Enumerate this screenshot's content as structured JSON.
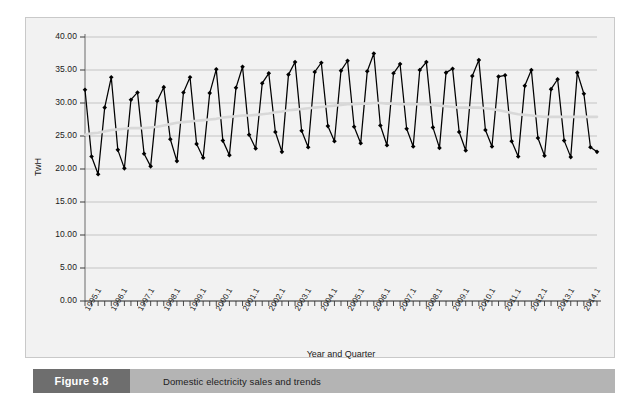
{
  "caption": {
    "number": "Figure 9.8",
    "text": "Domestic electricity sales and trends"
  },
  "chart_data": {
    "type": "line",
    "title": "",
    "xlabel": "Year and Quarter",
    "ylabel": "TwH",
    "ylim": [
      0,
      40
    ],
    "ytick_labels": [
      "0.00",
      "5.00",
      "10.00",
      "15.00",
      "20.00",
      "25.00",
      "30.00",
      "35.00",
      "40.00"
    ],
    "ytick_values": [
      0,
      5,
      10,
      15,
      20,
      25,
      30,
      35,
      40
    ],
    "grid": true,
    "legend_position": "none",
    "xtick_labels": [
      "1995.1",
      "1996.1",
      "1997.1",
      "1998.1",
      "1999.1",
      "2000.1",
      "2001.1",
      "2002.1",
      "2003.1",
      "2004.1",
      "2005.1",
      "2006.1",
      "2007.1",
      "2008.1",
      "2009.1",
      "2010.1",
      "2011.1",
      "2012.1",
      "2013.1",
      "2014.1"
    ],
    "xtick_interval_quarters": 4,
    "x": [
      "1995.1",
      "1995.2",
      "1995.3",
      "1995.4",
      "1996.1",
      "1996.2",
      "1996.3",
      "1996.4",
      "1997.1",
      "1997.2",
      "1997.3",
      "1997.4",
      "1998.1",
      "1998.2",
      "1998.3",
      "1998.4",
      "1999.1",
      "1999.2",
      "1999.3",
      "1999.4",
      "2000.1",
      "2000.2",
      "2000.3",
      "2000.4",
      "2001.1",
      "2001.2",
      "2001.3",
      "2001.4",
      "2002.1",
      "2002.2",
      "2002.3",
      "2002.4",
      "2003.1",
      "2003.2",
      "2003.3",
      "2003.4",
      "2004.1",
      "2004.2",
      "2004.3",
      "2004.4",
      "2005.1",
      "2005.2",
      "2005.3",
      "2005.4",
      "2006.1",
      "2006.2",
      "2006.3",
      "2006.4",
      "2007.1",
      "2007.2",
      "2007.3",
      "2007.4",
      "2008.1",
      "2008.2",
      "2008.3",
      "2008.4",
      "2009.1",
      "2009.2",
      "2009.3",
      "2009.4",
      "2010.1",
      "2010.2",
      "2010.3",
      "2010.4",
      "2011.1",
      "2011.2",
      "2011.3",
      "2011.4",
      "2012.1",
      "2012.2",
      "2012.3",
      "2012.4",
      "2013.1",
      "2013.2",
      "2013.3",
      "2013.4",
      "2014.1",
      "2014.2",
      "2014.3"
    ],
    "series": [
      {
        "name": "Domestic electricity sales",
        "color": "#000000",
        "marker": "diamond",
        "values": [
          32.0,
          21.9,
          19.2,
          29.3,
          33.9,
          22.9,
          20.1,
          30.5,
          31.6,
          22.3,
          20.4,
          30.3,
          32.4,
          24.5,
          21.2,
          31.6,
          33.9,
          23.8,
          21.7,
          31.5,
          35.1,
          24.3,
          22.1,
          32.3,
          35.5,
          25.2,
          23.1,
          33.0,
          34.5,
          25.6,
          22.6,
          34.3,
          36.2,
          25.8,
          23.3,
          34.7,
          36.1,
          26.5,
          24.2,
          34.9,
          36.4,
          26.4,
          23.9,
          34.8,
          37.5,
          26.6,
          23.6,
          34.5,
          35.9,
          26.1,
          23.4,
          35.0,
          36.2,
          26.3,
          23.2,
          34.6,
          35.2,
          25.6,
          22.8,
          34.1,
          36.5,
          25.9,
          23.4,
          34.0,
          34.2,
          24.2,
          21.9,
          32.6,
          35.0,
          24.7,
          22.0,
          32.1,
          33.6,
          24.3,
          21.8,
          34.6,
          31.4,
          23.3,
          22.6
        ]
      },
      {
        "name": "Trend",
        "color": "#d8d8d8",
        "marker": "none",
        "values": [
          25.2,
          25.4,
          25.5,
          25.7,
          25.9,
          26.0,
          26.1,
          26.2,
          26.2,
          26.2,
          26.3,
          26.4,
          26.6,
          26.8,
          27.0,
          27.1,
          27.2,
          27.3,
          27.4,
          27.5,
          27.6,
          27.8,
          27.9,
          28.0,
          28.1,
          28.1,
          28.2,
          28.3,
          28.4,
          28.6,
          28.7,
          28.9,
          29.0,
          29.1,
          29.2,
          29.3,
          29.4,
          29.5,
          29.6,
          29.7,
          29.8,
          29.8,
          29.9,
          29.9,
          30.0,
          30.0,
          29.9,
          29.9,
          29.8,
          29.8,
          29.8,
          29.8,
          29.8,
          29.7,
          29.6,
          29.5,
          29.4,
          29.3,
          29.3,
          29.3,
          29.3,
          29.2,
          29.1,
          28.9,
          28.7,
          28.5,
          28.3,
          28.2,
          28.1,
          28.0,
          27.9,
          27.9,
          27.9,
          27.9,
          27.9,
          27.9,
          27.9,
          27.9,
          27.9
        ]
      }
    ]
  }
}
